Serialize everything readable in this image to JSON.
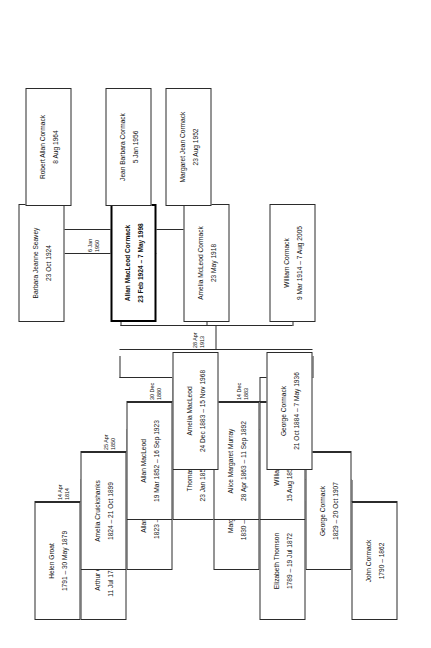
{
  "chart": {
    "type": "family-tree",
    "title": "",
    "orientation": "rotated-90-ccw",
    "line_color": "#2b2b2b",
    "box_fill": "#ffffff",
    "focus_person": "Allan MacLeod Cormack"
  },
  "people": {
    "helen_groat": {
      "name": "Helen Groat",
      "dates": "1791 – 30 May 1879"
    },
    "arthur_cruickshanks": {
      "name": "Arthur Cruickshanks",
      "dates": "11 Jul 1781 – circa 1845"
    },
    "elizabeth_thomson": {
      "name": "Elizabeth Thomson",
      "dates": "1789 – 19 Jul 1872"
    },
    "john_cormack": {
      "name": "John Cormack",
      "dates": "1790 – 1862"
    },
    "amelia_cruickshanks": {
      "name": "Amelia Cruickshanks",
      "dates": "1824  – 21 Oct 1899"
    },
    "allan_macleod_1823": {
      "name": "Allan MacLeod",
      "dates": "1823 – 9 Nov 1901"
    },
    "margaret_miller": {
      "name": "Margaret Miller",
      "dates": "1830 – 10 Jun 1915"
    },
    "george_cormack_1829": {
      "name": "George Cormack",
      "dates": "1829 – 20 Oct 1907"
    },
    "allan_macleod_1852": {
      "name": "Allan MacLeod",
      "dates": "19 Mar 1852 – 16 Sep 1923"
    },
    "thomasina_cormack": {
      "name": "Thomasina Cormack",
      "dates": "23 Jan 1859 – 22 Sep 1953"
    },
    "alice_margaret_murray": {
      "name": "Alice Margaret Murray",
      "dates": "28 Apr 1863 – 11 Sep 1892"
    },
    "william_cormack_1856": {
      "name": "William Cormack",
      "dates": "15 Aug 1856 – 25 Mar 1897"
    },
    "amelia_macleod": {
      "name": "Amelia MacLeod",
      "dates": "24 Dec 1883 – 15 Nov 1968"
    },
    "george_cormack_1884": {
      "name": "George Cormack",
      "dates": "21 Oct 1884 – 7 May 1936"
    },
    "barbara_jeanne_seavey": {
      "name": "Barbara Jeanne Seavey",
      "dates": "23 Oct 1924"
    },
    "allan_macleod_cormack": {
      "name": "Allan MacLeod Cormack",
      "dates": "23 Feb 1924 – 7 May 1998"
    },
    "amelia_mcleod_cormack": {
      "name": "Amelia McLeod Cormack",
      "dates": "23 May 1918"
    },
    "william_cormack_1914": {
      "name": "William Cormack",
      "dates": "9 Mar 1914 – 7 Aug 2005"
    },
    "robert_allan_cormack": {
      "name": "Robert Allan Cormack",
      "dates": "8 Aug 1964"
    },
    "jean_barbara_cormack": {
      "name": "Jean Barbara Cormack",
      "dates": "5 Jan 1956"
    },
    "margaret_jean_cormack": {
      "name": "Margaret Jean Cormack",
      "dates": "23 Aug 1952"
    }
  },
  "marriages": [
    {
      "id": "m_cruickshanks_groat",
      "day": "14 Apr",
      "year": "1814"
    },
    {
      "id": "m_macleod_cruickshanks",
      "day": "25 Apr",
      "year": "1850"
    },
    {
      "id": "m_macleod_cormack",
      "day": "30 Dec",
      "year": "1880"
    },
    {
      "id": "m_cormack_thomson",
      "day": "6 Feb",
      "year": "1819"
    },
    {
      "id": "m_cormack_miller",
      "day": "24 Sep",
      "year": "1852"
    },
    {
      "id": "m_cormack_murray",
      "day": "14 Dec",
      "year": "1883"
    },
    {
      "id": "m_cormack_macleod",
      "day": "28 Apr",
      "year": "1913"
    },
    {
      "id": "m_cormack_seavey",
      "day": "6 Jan",
      "year": "1950"
    }
  ]
}
